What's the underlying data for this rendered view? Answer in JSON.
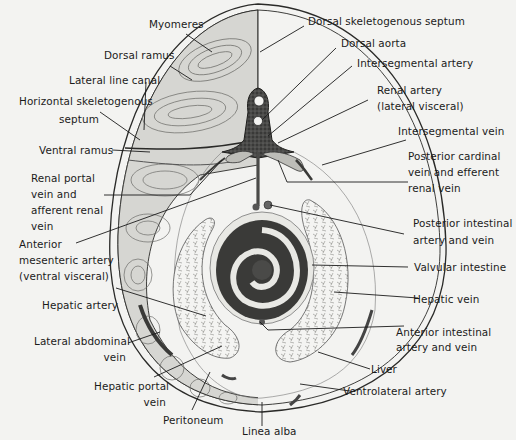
{
  "figure": {
    "colors": {
      "background": "#f3f3f1",
      "ink": "#1b1b1b",
      "muscle": "#bdbdb8",
      "vessel": "#4a4a48",
      "intestine_dark": "#3a3a38"
    }
  },
  "labels": {
    "myomeres": [
      "Myomeres"
    ],
    "dorsal_ramus": [
      "Dorsal ramus"
    ],
    "lateral_line_canal": [
      "Lateral line canal"
    ],
    "horizontal_septum": [
      "Horizontal skeletogenous",
      "septum"
    ],
    "ventral_ramus": [
      "Ventral ramus"
    ],
    "renal_portal_vein": [
      "Renal portal",
      "vein and",
      "afferent renal",
      "vein"
    ],
    "anterior_mesenteric": [
      "Anterior",
      "mesenteric artery",
      "(ventral visceral)"
    ],
    "hepatic_artery": [
      "Hepatic artery"
    ],
    "lateral_abdominal_vein": [
      "Lateral abdominal",
      "vein"
    ],
    "hepatic_portal_vein": [
      "Hepatic portal",
      "vein"
    ],
    "peritoneum": [
      "Peritoneum"
    ],
    "linea_alba": [
      "Linea alba"
    ],
    "dorsal_septum": [
      "Dorsal skeletogenous septum"
    ],
    "dorsal_aorta": [
      "Dorsal aorta"
    ],
    "intersegmental_artery": [
      "Intersegmental artery"
    ],
    "renal_artery": [
      "Renal artery",
      "(lateral visceral)"
    ],
    "intersegmental_vein": [
      "Intersegmental vein"
    ],
    "posterior_cardinal": [
      "Posterior cardinal",
      "vein and efferent",
      "renal vein"
    ],
    "posterior_intestinal": [
      "Posterior intestinal",
      "artery and vein"
    ],
    "valvular_intestine": [
      "Valvular intestine"
    ],
    "hepatic_vein": [
      "Hepatic vein"
    ],
    "anterior_intestinal": [
      "Anterior intestinal",
      "artery and vein"
    ],
    "liver": [
      "Liver"
    ],
    "ventrolateral_artery": [
      "Ventrolateral artery"
    ]
  }
}
